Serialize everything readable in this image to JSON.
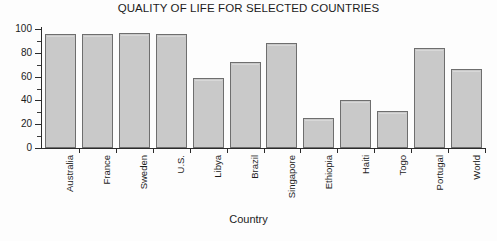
{
  "chart_data": {
    "type": "bar",
    "title": "QUALITY OF LIFE FOR SELECTED COUNTRIES",
    "xlabel": "Country",
    "ylabel": "",
    "categories": [
      "Australia",
      "France",
      "Sweden",
      "U.S.",
      "Libya",
      "Brazil",
      "Singapore",
      "Ethiopia",
      "Haiti",
      "Togo",
      "Portugal",
      "World"
    ],
    "values": [
      96,
      96,
      97,
      96,
      59,
      72,
      88,
      25,
      40,
      31,
      84,
      66
    ],
    "ylim": [
      0,
      100
    ],
    "yticks": [
      0,
      20,
      40,
      60,
      80,
      100
    ],
    "ytick_labels": [
      "0",
      "20",
      "40",
      "60",
      "80",
      "100"
    ],
    "yminor_step": 10,
    "grid": false,
    "legend": "none",
    "bar_fill_color": "#c9c9c9",
    "bar_edge_color": "#6e6e6e",
    "axis_color": "#2b2b2b",
    "background_color": "#fdfdfd"
  }
}
